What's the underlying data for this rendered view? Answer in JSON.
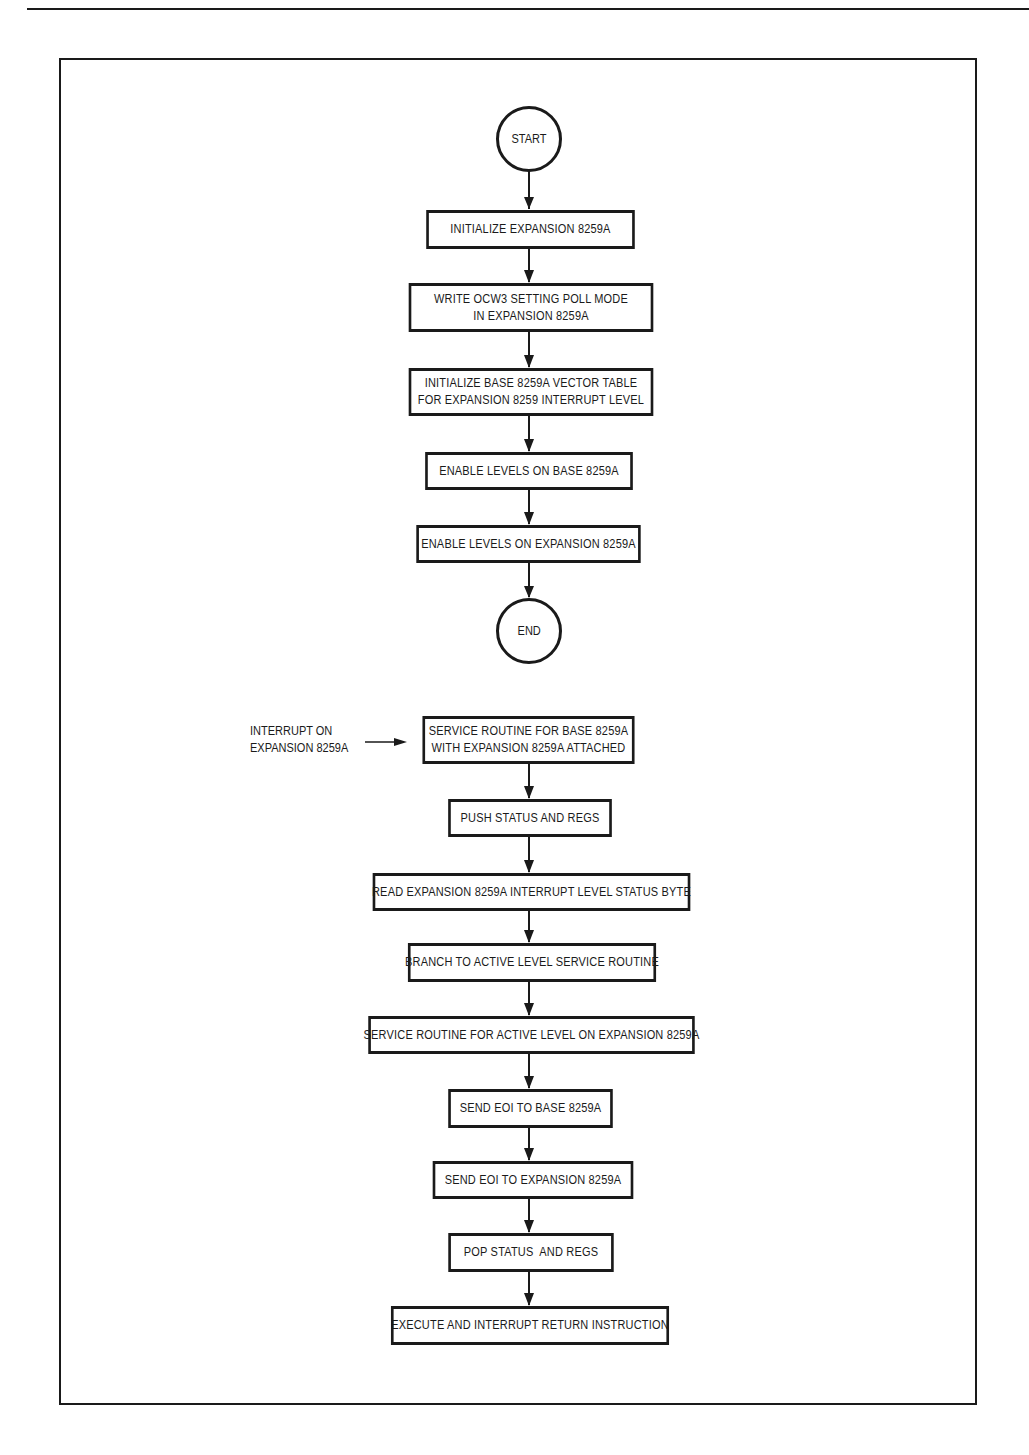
{
  "diagram": {
    "type": "flowchart",
    "colors": {
      "ink": "#1a1a1a",
      "paper": "#ffffff"
    },
    "init_flow": {
      "start": "START",
      "steps": [
        {
          "id": "s1",
          "lines": [
            "INITIALIZE EXPANSION 8259A"
          ]
        },
        {
          "id": "s2",
          "lines": [
            "WRITE OCW3 SETTING POLL MODE",
            "IN EXPANSION 8259A"
          ]
        },
        {
          "id": "s3",
          "lines": [
            "INITIALIZE BASE 8259A VECTOR TABLE",
            "FOR EXPANSION 8259 INTERRUPT LEVEL"
          ]
        },
        {
          "id": "s4",
          "lines": [
            "ENABLE LEVELS ON BASE 8259A"
          ]
        },
        {
          "id": "s5",
          "lines": [
            "ENABLE LEVELS ON EXPANSION 8259A"
          ]
        }
      ],
      "end": "END"
    },
    "interrupt_flow": {
      "entry_label": [
        "INTERRUPT ON",
        "EXPANSION 8259A"
      ],
      "steps": [
        {
          "id": "i1",
          "lines": [
            "SERVICE ROUTINE FOR BASE 8259A",
            "WITH EXPANSION 8259A ATTACHED"
          ]
        },
        {
          "id": "i2",
          "lines": [
            "PUSH STATUS AND REGS"
          ]
        },
        {
          "id": "i3",
          "lines": [
            "READ EXPANSION 8259A INTERRUPT LEVEL STATUS BYTE"
          ]
        },
        {
          "id": "i4",
          "lines": [
            "BRANCH TO ACTIVE LEVEL SERVICE ROUTINE"
          ]
        },
        {
          "id": "i5",
          "lines": [
            "SERVICE ROUTINE FOR ACTIVE LEVEL ON EXPANSION 8259A"
          ]
        },
        {
          "id": "i6",
          "lines": [
            "SEND EOI TO BASE 8259A"
          ]
        },
        {
          "id": "i7",
          "lines": [
            "SEND EOI TO EXPANSION 8259A"
          ]
        },
        {
          "id": "i8",
          "lines": [
            "POP STATUS  AND REGS"
          ]
        },
        {
          "id": "i9",
          "lines": [
            "EXECUTE AND INTERRUPT RETURN INSTRUCTION"
          ]
        }
      ]
    }
  }
}
